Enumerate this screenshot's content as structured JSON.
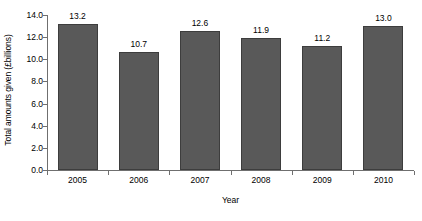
{
  "chart_data": {
    "type": "bar",
    "title": "",
    "subtitle": "",
    "xlabel": "Year",
    "ylabel": "Total amounts given (£billions)",
    "categories": [
      "2005",
      "2006",
      "2007",
      "2008",
      "2009",
      "2010"
    ],
    "values": [
      13.2,
      10.7,
      12.6,
      11.9,
      11.2,
      13.0
    ],
    "data_labels": [
      "13.2",
      "10.7",
      "12.6",
      "11.9",
      "11.2",
      "13.0"
    ],
    "ylim": [
      0.0,
      14.0
    ],
    "ytick_labels": [
      "0.0",
      "2.0",
      "4.0",
      "6.0",
      "8.0",
      "10.0",
      "12.0",
      "14.0"
    ],
    "ytick_values": [
      0.0,
      2.0,
      4.0,
      6.0,
      8.0,
      10.0,
      12.0,
      14.0
    ],
    "grid": false,
    "legend": false,
    "legend_position": "none",
    "bar_color": "#595959",
    "bar_edge_color": "#3d3d3d",
    "axis_color": "#6f6f6f",
    "background_color": "#ffffff"
  }
}
